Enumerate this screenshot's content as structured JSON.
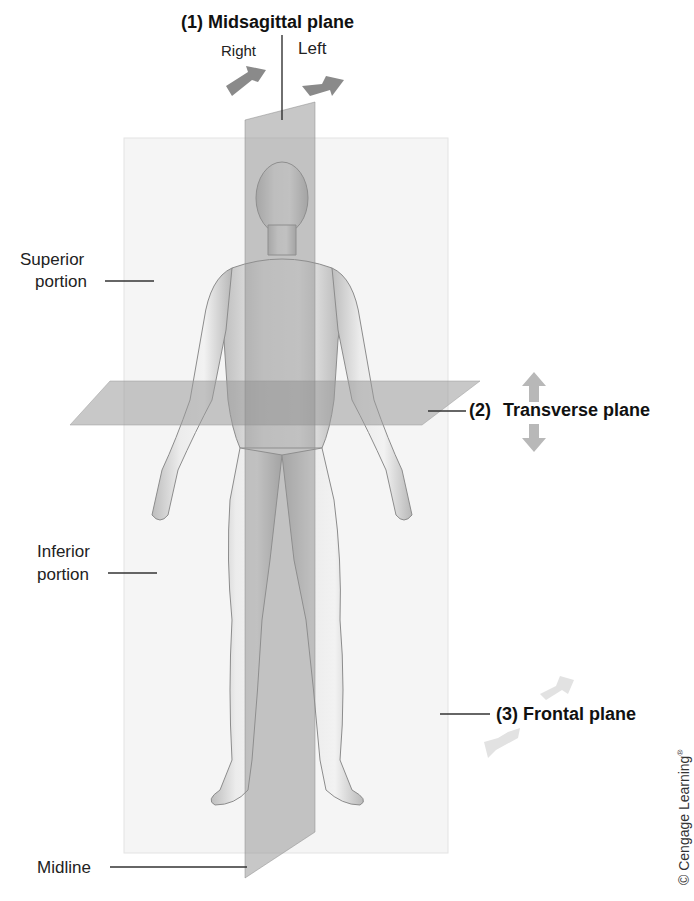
{
  "figure": {
    "planes": [
      {
        "number": "(1)",
        "name": "Midsagittal plane",
        "label": "(1) Midsagittal plane",
        "directions": [
          "Right",
          "Left"
        ]
      },
      {
        "number": "(2)",
        "name": "Transverse plane",
        "label_num": "(2)",
        "label_text": "Transverse plane",
        "directions": [
          "up",
          "down"
        ]
      },
      {
        "number": "(3)",
        "name": "Frontal plane",
        "label": "(3) Frontal plane"
      }
    ],
    "side_labels": {
      "superior": [
        "Superior",
        "portion"
      ],
      "inferior": [
        "Inferior",
        "portion"
      ],
      "midline": "Midline"
    },
    "direction_labels": {
      "right": "Right",
      "left": "Left"
    },
    "copyright": "© Cengage Learning",
    "copyright_mark": "®"
  },
  "colors": {
    "plane_fill": "#9a9a9a",
    "frontal_fill": "#f4f4f4",
    "arrow_dark": "#8a8a8a",
    "arrow_mid": "#b5b5b5",
    "arrow_light": "#e0e0e0",
    "skin": "#e4e4e4",
    "text": "#1a1a1a"
  }
}
